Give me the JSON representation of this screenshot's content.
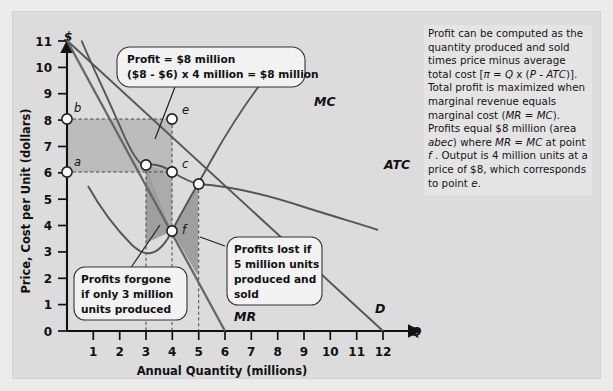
{
  "figure": {
    "background_color": "#ebebeb",
    "panel_color": "#dcdcdc"
  },
  "axes": {
    "y_axis_label": "Price, Cost per Unit (dollars)",
    "x_axis_label": "Annual Quantity (millions)",
    "y_axis_symbol": "$",
    "x_axis_symbol": "Q",
    "y_ticks": [
      "0",
      "1",
      "2",
      "3",
      "4",
      "5",
      "6",
      "7",
      "8",
      "9",
      "10",
      "11",
      "12"
    ],
    "x_ticks": [
      "1",
      "2",
      "3",
      "4",
      "5",
      "6",
      "7",
      "8",
      "9",
      "10",
      "11",
      "12"
    ]
  },
  "curve_labels": {
    "mc": "MC",
    "atc": "ATC",
    "mr": "MR",
    "d": "D"
  },
  "point_labels": {
    "a": "a",
    "b": "b",
    "c": "c",
    "e": "e",
    "f": "f"
  },
  "callouts": {
    "profit": {
      "line1": "Profit = $8 million",
      "line2": "($8 - $6) x 4 million = $8 million"
    },
    "forgone": {
      "line1": "Profits forgone",
      "line2": "if only 3 million",
      "line3": "units produced"
    },
    "lost": {
      "line1": "Profits lost if",
      "line2": "5 million units",
      "line3": "produced and",
      "line4": "sold"
    }
  },
  "explanation": {
    "html": "Profit can be computed as the quantity produced and sold times price minus average total cost [<span class=\"ital\">&#960;</span> = <span class=\"ital\">Q</span> x (<span class=\"ital\">P - ATC</span>)].&nbsp; Total profit is maximized when marginal revenue equals marginal cost (<span class=\"ital\">MR = MC</span>).&nbsp; Profits equal $8 million (area <span class=\"ital\">abec</span>) where <span class=\"ital\">MR = MC</span> at point <span class=\"ital\">f</span> . Output is 4 million units at a price of $8, which corresponds to point <span class=\"ital\">e</span>."
  },
  "chart_data": {
    "type": "line",
    "title": "",
    "xlabel": "Annual Quantity (millions)",
    "ylabel": "Price, Cost per Unit (dollars)",
    "xlim": [
      0,
      12.6
    ],
    "ylim": [
      0,
      12.6
    ],
    "grid": false,
    "legend": "inline-curve-labels",
    "series": [
      {
        "name": "D",
        "label": "D",
        "type": "line",
        "x": [
          0,
          12
        ],
        "y": [
          12,
          0
        ],
        "note": "Demand curve, straight line from (0,12) to (12,0)"
      },
      {
        "name": "MR",
        "label": "MR",
        "type": "line",
        "x": [
          0,
          6
        ],
        "y": [
          12,
          0
        ],
        "note": "Marginal revenue, straight line from (0,12) to (6,0)"
      },
      {
        "name": "ATC",
        "label": "ATC",
        "type": "curve",
        "x": [
          0.55,
          1,
          1.5,
          2,
          2.5,
          3,
          3.5,
          4,
          4.5,
          5,
          6,
          7,
          8,
          9,
          10,
          11,
          11.8
        ],
        "y": [
          12,
          10.1,
          8.6,
          7.6,
          6.85,
          6.3,
          6.1,
          6.0,
          5.75,
          5.6,
          5.65,
          5.85,
          6.1,
          6.4,
          6.75,
          7.15,
          7.45
        ],
        "note": "U-shaped average total cost curve, minimum near Q=5 at about $5.6"
      },
      {
        "name": "MC",
        "label": "MC",
        "type": "curve",
        "x": [
          0.8,
          1.2,
          1.7,
          2.2,
          2.7,
          3,
          3.4,
          4,
          4.6,
          5,
          5.6,
          6.2,
          6.8,
          7.5,
          8.1,
          8.6
        ],
        "y": [
          5.5,
          4.6,
          3.85,
          3.35,
          3.1,
          3.1,
          3.35,
          3.8,
          4.6,
          5.1,
          6.1,
          7.1,
          8.1,
          9.3,
          10.3,
          11.1
        ],
        "note": "U-shaped marginal cost curve, minimum about $3.1 near Q=3"
      }
    ],
    "points": [
      {
        "label": "b",
        "x": 0,
        "y": 8,
        "desc": "price level on vertical axis"
      },
      {
        "label": "a",
        "x": 0,
        "y": 6,
        "desc": "ATC level on vertical axis"
      },
      {
        "label": "e",
        "x": 4,
        "y": 8,
        "desc": "point on demand curve, profit-maximizing price"
      },
      {
        "label": "c",
        "x": 4,
        "y": 6,
        "desc": "corner of profit rectangle"
      },
      {
        "label": "f",
        "x": 4,
        "y": 3.8,
        "desc": "MR = MC intersection"
      },
      {
        "label": "",
        "x": 3,
        "y": 6.3,
        "desc": "ATC at 3 million units"
      },
      {
        "label": "",
        "x": 5,
        "y": 5.6,
        "desc": "ATC at 5 million units"
      }
    ],
    "shaded_regions": [
      {
        "name": "profit-rectangle-abec",
        "vertices": [
          [
            0,
            6
          ],
          [
            0,
            8
          ],
          [
            4,
            8
          ],
          [
            4,
            6
          ]
        ],
        "shade": "medium",
        "value": "$8 million"
      },
      {
        "name": "profits-forgone-triangle",
        "vertices": [
          [
            3,
            6.3
          ],
          [
            3,
            3.35
          ],
          [
            4,
            3.8
          ]
        ],
        "shade": "dark"
      },
      {
        "name": "profits-lost-triangle",
        "vertices": [
          [
            4,
            3.8
          ],
          [
            5,
            5.6
          ],
          [
            5,
            2.1
          ]
        ],
        "shade": "dark"
      }
    ],
    "annotations": [
      "Profit = $8 million ($8 - $6) x 4 million = $8 million",
      "Profits forgone if only 3 million units produced",
      "Profits lost if 5 million units produced and sold"
    ]
  }
}
